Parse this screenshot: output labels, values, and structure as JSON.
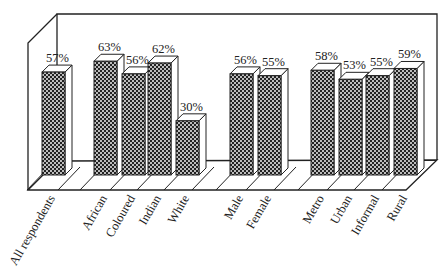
{
  "chart_data": {
    "type": "bar",
    "style": "3d",
    "title": "",
    "xlabel": "",
    "ylabel": "",
    "ylim": [
      0,
      100
    ],
    "grid": false,
    "legend": null,
    "categories": [
      "All respondents",
      "African",
      "Coloured",
      "Indian",
      "White",
      "Male",
      "Female",
      "Metro",
      "Urban",
      "Informal",
      "Rural"
    ],
    "values": [
      57,
      63,
      56,
      62,
      30,
      56,
      55,
      58,
      53,
      55,
      59
    ],
    "value_labels": [
      "57%",
      "63%",
      "56%",
      "62%",
      "30%",
      "56%",
      "55%",
      "58%",
      "53%",
      "55%",
      "59%"
    ],
    "groups": [
      {
        "name": "total",
        "categories": [
          "All respondents"
        ]
      },
      {
        "name": "race",
        "categories": [
          "African",
          "Coloured",
          "Indian",
          "White"
        ]
      },
      {
        "name": "gender",
        "categories": [
          "Male",
          "Female"
        ]
      },
      {
        "name": "area",
        "categories": [
          "Metro",
          "Urban",
          "Informal",
          "Rural"
        ]
      }
    ],
    "fill_pattern": "crosshatch",
    "colors": {
      "bar_fill": "#222222",
      "bar_side": "#ffffff",
      "outline": "#222222",
      "background": "#ffffff"
    }
  }
}
